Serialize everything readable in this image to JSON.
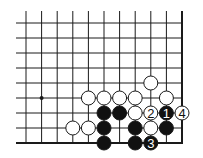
{
  "diagram": {
    "type": "go-board-fragment",
    "colors": {
      "background": "#ffffff",
      "line": "#1a1a1a",
      "black_stone": "#111111",
      "white_stone": "#ffffff",
      "stone_outline": "#1a1a1a"
    },
    "grid": {
      "columns": 11,
      "rows": 9,
      "x0": 26,
      "dx": 15.6,
      "y0": 23,
      "dy": 15,
      "left_overhang_x": 16,
      "top_overhang_y": 11,
      "right_edge": true,
      "bottom_edge": true
    },
    "star_points": [
      {
        "col": 1,
        "row": 5
      }
    ],
    "stones": [
      {
        "col": 8,
        "row": 4,
        "color": "white",
        "label": ""
      },
      {
        "col": 4,
        "row": 5,
        "color": "white",
        "label": ""
      },
      {
        "col": 5,
        "row": 5,
        "color": "white",
        "label": ""
      },
      {
        "col": 6,
        "row": 5,
        "color": "white",
        "label": ""
      },
      {
        "col": 7,
        "row": 5,
        "color": "white",
        "label": ""
      },
      {
        "col": 9,
        "row": 5,
        "color": "white",
        "label": ""
      },
      {
        "col": 5,
        "row": 6,
        "color": "black",
        "label": ""
      },
      {
        "col": 6,
        "row": 6,
        "color": "black",
        "label": ""
      },
      {
        "col": 7,
        "row": 6,
        "color": "white",
        "label": ""
      },
      {
        "col": 8,
        "row": 6,
        "color": "white",
        "label": "2"
      },
      {
        "col": 9,
        "row": 6,
        "color": "black",
        "label": "1"
      },
      {
        "col": 10,
        "row": 6,
        "color": "white",
        "label": "4"
      },
      {
        "col": 3,
        "row": 7,
        "color": "white",
        "label": ""
      },
      {
        "col": 4,
        "row": 7,
        "color": "white",
        "label": ""
      },
      {
        "col": 5,
        "row": 7,
        "color": "black",
        "label": ""
      },
      {
        "col": 7,
        "row": 7,
        "color": "black",
        "label": ""
      },
      {
        "col": 8,
        "row": 7,
        "color": "white",
        "label": ""
      },
      {
        "col": 9,
        "row": 7,
        "color": "black",
        "label": ""
      },
      {
        "col": 5,
        "row": 8,
        "color": "black",
        "label": ""
      },
      {
        "col": 7,
        "row": 8,
        "color": "black",
        "label": ""
      },
      {
        "col": 8,
        "row": 8,
        "color": "black",
        "label": "3"
      }
    ]
  }
}
